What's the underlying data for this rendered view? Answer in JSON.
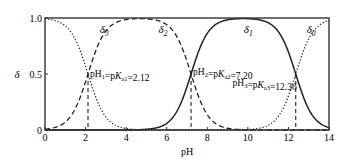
{
  "chart_data": {
    "type": "line",
    "title": "",
    "xlabel": "pH",
    "ylabel": "δ",
    "xlim": [
      0,
      14
    ],
    "ylim": [
      0,
      1.0
    ],
    "xticks": [
      "0",
      "2",
      "4",
      "6",
      "8",
      "10",
      "12",
      "14"
    ],
    "yticks": [
      "0",
      "0.5",
      "1.0"
    ],
    "grid": false,
    "pKa": [
      2.12,
      7.2,
      12.36
    ],
    "series": [
      {
        "name": "δ3",
        "label_main": "δ",
        "label_sub": "3",
        "style": "dotted",
        "label_pH": 2.7,
        "label_y": 0.9
      },
      {
        "name": "δ2",
        "label_main": "δ",
        "label_sub": "2",
        "style": "dashed",
        "label_pH": 5.6,
        "label_y": 0.9
      },
      {
        "name": "δ1",
        "label_main": "δ",
        "label_sub": "1",
        "style": "solid",
        "label_pH": 9.8,
        "label_y": 0.9
      },
      {
        "name": "δ0",
        "label_main": "δ",
        "label_sub": "0",
        "style": "dotted",
        "label_pH": 12.9,
        "label_y": 0.9
      }
    ],
    "annotations": [
      {
        "pre": "pH",
        "sub1": "1",
        "mid": "=p",
        "k": "K",
        "sub2": "a1",
        "post": "=2.12",
        "pH": 2.12
      },
      {
        "pre": "pH",
        "sub1": "2",
        "mid": "=p",
        "k": "K",
        "sub2": "a2",
        "post": "=7.20",
        "pH": 7.2
      },
      {
        "pre": "pH",
        "sub1": "3",
        "mid": "=p",
        "k": "K",
        "sub2": "a3",
        "post": "=12.36",
        "pH": 12.36
      }
    ]
  }
}
